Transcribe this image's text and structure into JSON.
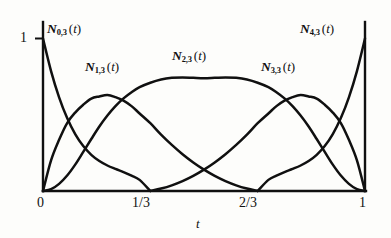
{
  "figure": {
    "name": "cubic-b-spline-basis-functions",
    "background_color": "#fdfdfb",
    "line_color": "#101010"
  },
  "axes": {
    "y_tick_label_1": "1",
    "x_tick_labels": [
      "0",
      "1/3",
      "2/3",
      "1"
    ],
    "x_axis_title": "t"
  },
  "curve_labels": {
    "n0": {
      "symbol": "N",
      "sub": "0,3",
      "arg": "(t)"
    },
    "n1": {
      "symbol": "N",
      "sub": "1,3",
      "arg": "(t)"
    },
    "n2": {
      "symbol": "N",
      "sub": "2,3",
      "arg": "(t)"
    },
    "n3": {
      "symbol": "N",
      "sub": "3,3",
      "arg": "(t)"
    },
    "n4": {
      "symbol": "N",
      "sub": "4,3",
      "arg": "(t)"
    }
  },
  "chart_data": {
    "type": "line",
    "title": "",
    "xlabel": "t",
    "ylabel": "",
    "xlim": [
      0,
      1
    ],
    "ylim": [
      0,
      1
    ],
    "grid": false,
    "legend": "inline-annotations",
    "degree": 3,
    "knots": [
      0,
      0,
      0,
      0,
      0.3333333333,
      0.6666666667,
      1,
      1,
      1,
      1
    ],
    "x_ticks": [
      0,
      0.3333333333,
      0.6666666667,
      1
    ],
    "x_tick_text": [
      "0",
      "1/3",
      "2/3",
      "1"
    ],
    "y_ticks": [
      1
    ],
    "y_tick_text": [
      "1"
    ],
    "x": [
      0,
      0.025,
      0.05,
      0.075,
      0.1,
      0.125,
      0.15,
      0.175,
      0.2,
      0.225,
      0.25,
      0.275,
      0.3,
      0.3333333333,
      0.3666666667,
      0.4,
      0.4333333333,
      0.4666666667,
      0.5,
      0.5333333333,
      0.5666666667,
      0.6,
      0.6333333333,
      0.6666666667,
      0.7,
      0.725,
      0.75,
      0.775,
      0.8,
      0.825,
      0.85,
      0.875,
      0.9,
      0.925,
      0.95,
      0.975,
      1
    ],
    "series": [
      {
        "name": "N_{0,3}(t)",
        "peak_value": 1.0,
        "peak_x": 0.0,
        "support": [
          0,
          0.3333333333
        ],
        "values": [
          1.0,
          0.7865,
          0.6141,
          0.478,
          0.373,
          0.2944,
          0.2371,
          0.1964,
          0.1672,
          0.1449,
          0.1244,
          0.1011,
          0.0729,
          0.0,
          0.0,
          0.0,
          0.0,
          0.0,
          0.0,
          0.0,
          0.0,
          0.0,
          0.0,
          0.0,
          0.0,
          0.0,
          0.0,
          0.0,
          0.0,
          0.0,
          0.0,
          0.0,
          0.0,
          0.0,
          0.0,
          0.0,
          0.0
        ]
      },
      {
        "name": "N_{1,3}(t)",
        "peak_value": 0.63,
        "peak_x": 0.186,
        "support": [
          0,
          0.6666666667
        ],
        "values": [
          0.0,
          0.2009,
          0.3359,
          0.4458,
          0.5144,
          0.5657,
          0.606,
          0.6202,
          0.6295,
          0.6157,
          0.5928,
          0.5566,
          0.5082,
          0.4444,
          0.3698,
          0.3022,
          0.2414,
          0.1873,
          0.14,
          0.0992,
          0.065,
          0.0373,
          0.016,
          0.0,
          0.0,
          0.0,
          0.0,
          0.0,
          0.0,
          0.0,
          0.0,
          0.0,
          0.0,
          0.0,
          0.0,
          0.0,
          0.0
        ]
      },
      {
        "name": "N_{2,3}(t)",
        "peak_value": 0.74,
        "peak_x": 0.5,
        "support": [
          0,
          1
        ],
        "values": [
          0.0,
          0.0121,
          0.0468,
          0.1014,
          0.173,
          0.2563,
          0.3408,
          0.423,
          0.495,
          0.5565,
          0.6075,
          0.6481,
          0.681,
          0.71,
          0.731,
          0.742,
          0.745,
          0.742,
          0.739,
          0.742,
          0.745,
          0.742,
          0.731,
          0.71,
          0.681,
          0.6481,
          0.6075,
          0.5565,
          0.495,
          0.423,
          0.3408,
          0.2563,
          0.173,
          0.1014,
          0.0468,
          0.0121,
          0.0
        ]
      },
      {
        "name": "N_{3,3}(t)",
        "peak_value": 0.63,
        "peak_x": 0.814,
        "support": [
          0.3333333333,
          1
        ],
        "values": [
          0.0,
          0.0,
          0.0,
          0.0,
          0.0,
          0.0,
          0.0,
          0.0,
          0.0,
          0.0,
          0.0,
          0.0,
          0.0,
          0.0,
          0.016,
          0.0373,
          0.065,
          0.0992,
          0.14,
          0.1873,
          0.2414,
          0.3022,
          0.3698,
          0.4444,
          0.5082,
          0.5566,
          0.5928,
          0.6157,
          0.6295,
          0.6202,
          0.606,
          0.5657,
          0.5144,
          0.4458,
          0.3359,
          0.2009,
          0.0
        ]
      },
      {
        "name": "N_{4,3}(t)",
        "peak_value": 1.0,
        "peak_x": 1.0,
        "support": [
          0.6666666667,
          1
        ],
        "values": [
          0.0,
          0.0,
          0.0,
          0.0,
          0.0,
          0.0,
          0.0,
          0.0,
          0.0,
          0.0,
          0.0,
          0.0,
          0.0,
          0.0,
          0.0,
          0.0,
          0.0,
          0.0,
          0.0,
          0.0,
          0.0,
          0.0,
          0.0,
          0.0,
          0.0729,
          0.1011,
          0.1244,
          0.1449,
          0.1672,
          0.1964,
          0.2371,
          0.2944,
          0.373,
          0.478,
          0.6141,
          0.7865,
          1.0
        ]
      }
    ]
  }
}
